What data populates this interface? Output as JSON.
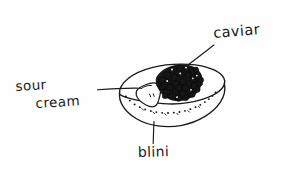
{
  "diagram": {
    "medium": "hand-drawn ink sketch",
    "background_color": "#fefefe",
    "ink_color": "#1a1a1a",
    "canvas": {
      "width": 295,
      "height": 178
    }
  },
  "labels": {
    "caviar": "caviar",
    "sour": "sour",
    "cream": "cream",
    "blini": "blini"
  },
  "parts": [
    {
      "key": "caviar",
      "label": "caviar",
      "description": "cluster of dark roe beads mounded on the right side of the blini",
      "color": "#161616"
    },
    {
      "key": "sour-cream",
      "label": "sour cream",
      "description": "white dollop resting on the left of the blini surface",
      "color": "#ffffff"
    },
    {
      "key": "blini",
      "label": "blini",
      "description": "oval pancake base drawn in perspective with a dotted rim",
      "color": "#fefefe"
    }
  ],
  "leaders": [
    {
      "from": "caviar-label",
      "to": "caviar-mound"
    },
    {
      "from": "sour-cream-label",
      "to": "cream-dollop"
    },
    {
      "from": "blini-label",
      "to": "blini-edge"
    }
  ]
}
